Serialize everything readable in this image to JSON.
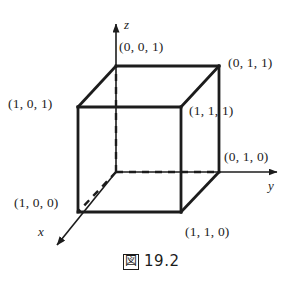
{
  "figure": {
    "caption_marker": "図",
    "caption_number": "19.2",
    "background_color": "#ffffff",
    "line_color": "#1c1c1c",
    "axes": [
      {
        "name": "x",
        "label": "x",
        "direction": "down-left"
      },
      {
        "name": "y",
        "label": "y",
        "direction": "right"
      },
      {
        "name": "z",
        "label": "z",
        "direction": "up"
      }
    ],
    "vertices": [
      {
        "name": "origin-back-bottom-left",
        "label": "(0, 0, 0)",
        "visible_label": false
      },
      {
        "name": "top-back-left",
        "label": "(0, 0, 1)",
        "visible_label": true
      },
      {
        "name": "top-back-right",
        "label": "(0, 1, 1)",
        "visible_label": true
      },
      {
        "name": "top-front-left",
        "label": "(1, 0, 1)",
        "visible_label": true
      },
      {
        "name": "top-front-right",
        "label": "(1, 1, 1)",
        "visible_label": true
      },
      {
        "name": "bottom-back-right",
        "label": "(0, 1, 0)",
        "visible_label": true
      },
      {
        "name": "bottom-front-left",
        "label": "(1, 0, 0)",
        "visible_label": true
      },
      {
        "name": "bottom-front-right",
        "label": "(1, 1, 0)",
        "visible_label": true
      }
    ]
  },
  "labels": {
    "v001": "(0, 0, 1)",
    "v011": "(0, 1, 1)",
    "v101": "(1, 0, 1)",
    "v111": "(1, 1, 1)",
    "v010": "(0, 1, 0)",
    "v100": "(1, 0, 0)",
    "v110": "(1, 1, 0)",
    "axis_x": "x",
    "axis_y": "y",
    "axis_z": "z"
  }
}
